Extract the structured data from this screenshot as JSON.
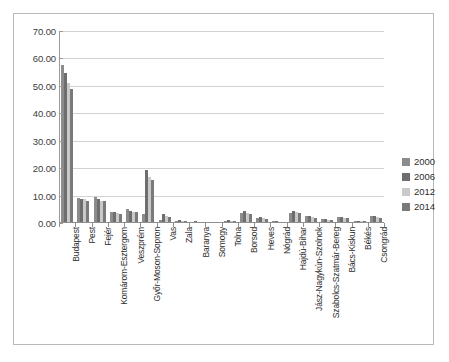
{
  "chart_data": {
    "type": "bar",
    "title": "",
    "xlabel": "",
    "ylabel": "",
    "ylim": [
      0,
      70
    ],
    "ytick_labels": [
      "0.00",
      "10.00",
      "20.00",
      "30.00",
      "40.00",
      "50.00",
      "60.00",
      "70.00"
    ],
    "ytick_values": [
      0,
      10,
      20,
      30,
      40,
      50,
      60,
      70
    ],
    "grid": true,
    "legend_position": "right",
    "categories": [
      "Budapest",
      "Pest",
      "Fejér",
      "Komárom-Esztergom",
      "Veszprém",
      "Győr-Moson-Sopron",
      "Vas",
      "Zala",
      "Baranya",
      "Somogy",
      "Tolna",
      "Borsod",
      "Heves",
      "Nógrád",
      "Hajdú-Bihar",
      "Jász-Nagykún-Szolnok",
      "Szabolcs-Szatmár-Bereg",
      "Bács-Kiskun",
      "Békés",
      "Csongrád"
    ],
    "series": [
      {
        "name": "2000",
        "color": "#8c8c8c",
        "values": [
          57.5,
          9.3,
          9.6,
          4.0,
          5.2,
          3.4,
          1.2,
          0.7,
          0.5,
          0.4,
          0.9,
          3.8,
          2.0,
          0.6,
          3.8,
          2.4,
          1.3,
          2.1,
          0.7,
          2.4
        ]
      },
      {
        "name": "2006",
        "color": "#6e6e6e",
        "values": [
          54.6,
          8.9,
          8.6,
          3.9,
          4.4,
          19.4,
          3.4,
          1.0,
          0.6,
          0.5,
          1.0,
          4.2,
          2.2,
          0.7,
          4.4,
          2.6,
          1.5,
          2.3,
          0.9,
          2.6
        ]
      },
      {
        "name": "2012",
        "color": "#c9c9c9",
        "values": [
          51.0,
          8.6,
          8.2,
          3.6,
          4.1,
          16.8,
          2.5,
          0.9,
          0.5,
          0.4,
          0.8,
          3.6,
          1.8,
          0.5,
          3.9,
          2.2,
          1.2,
          1.9,
          0.6,
          2.2
        ]
      },
      {
        "name": "2014",
        "color": "#7a7a7a",
        "values": [
          49.0,
          8.2,
          7.9,
          3.4,
          3.9,
          15.8,
          2.2,
          0.8,
          0.5,
          0.4,
          0.7,
          3.4,
          1.6,
          0.5,
          3.6,
          2.0,
          1.1,
          1.8,
          0.6,
          2.0
        ]
      }
    ]
  },
  "legend": {
    "items": [
      {
        "label": "2000",
        "color": "#8c8c8c"
      },
      {
        "label": "2006",
        "color": "#6e6e6e"
      },
      {
        "label": "2012",
        "color": "#c9c9c9"
      },
      {
        "label": "2014",
        "color": "#7a7a7a"
      }
    ]
  }
}
